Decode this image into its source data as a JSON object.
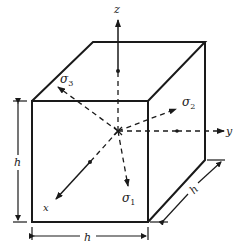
{
  "diagram": {
    "axes": {
      "x": "x",
      "y": "y",
      "z": "z"
    },
    "stresses": {
      "s1": "σ",
      "s1_sub": "1",
      "s2": "σ",
      "s2_sub": "2",
      "s3": "σ",
      "s3_sub": "3"
    },
    "dimensions": {
      "height": "h",
      "width": "h",
      "depth": "h"
    },
    "colors": {
      "ink": "#1a1a1a",
      "background": "#ffffff"
    }
  }
}
